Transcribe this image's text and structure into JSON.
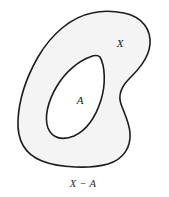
{
  "figure": {
    "caption": "X − A",
    "labels": {
      "outer_region": "X",
      "inner_region": "A"
    },
    "colors": {
      "stroke": "#1c1c1c",
      "shaded_fill": "#f4f4f4",
      "hole_fill": "#ffffff",
      "background": "#ffffff",
      "label_color": "#1a1a1a",
      "caption_color": "#2a2a2a"
    },
    "geometry": {
      "outer_blob_path": "M 124 13 C 143 17 151 30 150 44 C 149 58 138 70 129 79 C 121 87 118 95 121 104 C 124 113 129 121 130 133 C 131 147 124 159 108 164 C 90 169 60 168 42 161 C 24 154 17 140 18 120 C 19 100 26 78 38 57 C 52 33 72 17 92 13 C 104 10 114 11 124 13 Z",
      "inner_teardrop_path": "M 100 57 C 105 66 106 84 101 100 C 96 116 87 130 74 136 C 62 141 52 138 48 128 C 44 117 48 101 57 86 C 66 71 79 61 90 57 C 95 55 98 55 100 57 Z",
      "outer_label_pos": {
        "x": 120,
        "y": 44
      },
      "inner_label_pos": {
        "x": 80,
        "y": 101
      },
      "caption_pos": {
        "x": 83,
        "y": 187
      },
      "stroke_width": 1.6,
      "viewbox": "0 0 169 197"
    }
  }
}
